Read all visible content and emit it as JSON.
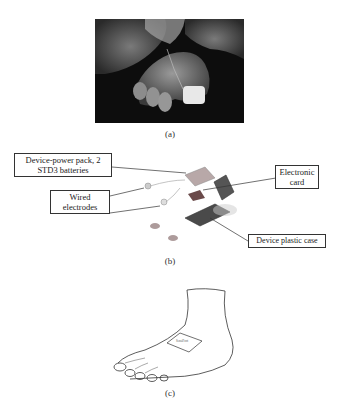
{
  "figure": {
    "panels": [
      {
        "id": "a",
        "caption": "(a)",
        "kind": "photograph",
        "description": "Baby foot held by hands with wired sensor taped to big toe"
      },
      {
        "id": "b",
        "caption": "(b)",
        "kind": "device-diagram",
        "callouts": [
          {
            "label": "Device-power pack, 2 STD3 batteries"
          },
          {
            "label": "Wired electrodes"
          },
          {
            "label": "Electronic card"
          },
          {
            "label": "Device plastic case"
          }
        ]
      },
      {
        "id": "c",
        "caption": "(c)",
        "kind": "line-drawing",
        "patch_label": "SensiFoot"
      }
    ],
    "colors": {
      "photo_dark": "#0d0d0d",
      "skin_gray": "#8a8a8a",
      "device_gray": "#5a5a5a",
      "line": "#333333"
    }
  }
}
